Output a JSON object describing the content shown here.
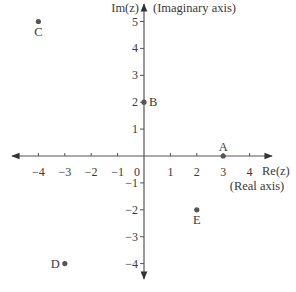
{
  "diagram": {
    "colors": {
      "axis": "#444444",
      "point": "#555555",
      "text": "#3a3a3a"
    },
    "origin_px": {
      "x": 144,
      "y": 156
    },
    "unit_px": {
      "x": 26.4,
      "y": 26.9
    },
    "x_axis": {
      "label": "Re(z)",
      "sublabel": "(Real axis)",
      "ticks": [
        -4,
        -3,
        -2,
        -1,
        1,
        2,
        3,
        4
      ],
      "tick_labels": [
        "−4",
        "−3",
        "−2",
        "−1",
        "1",
        "2",
        "3",
        "4"
      ]
    },
    "y_axis": {
      "label": "Im(z)",
      "sublabel": "(Imaginary axis)",
      "ticks": [
        5,
        4,
        3,
        2,
        1,
        -1,
        -2,
        -3,
        -4
      ],
      "tick_labels": [
        "5",
        "4",
        "3",
        "2",
        "1",
        "−1",
        "−2",
        "−3",
        "−4"
      ]
    },
    "origin_label": "0",
    "points": [
      {
        "name": "A",
        "re": 3,
        "im": 0,
        "label_pos": "above"
      },
      {
        "name": "B",
        "re": 0,
        "im": 2,
        "label_pos": "right"
      },
      {
        "name": "C",
        "re": -4,
        "im": 5,
        "label_pos": "below"
      },
      {
        "name": "D",
        "re": -3,
        "im": -4,
        "label_pos": "left"
      },
      {
        "name": "E",
        "re": 2,
        "im": -2,
        "label_pos": "below"
      }
    ]
  }
}
